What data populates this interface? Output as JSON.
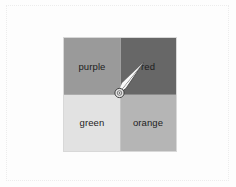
{
  "page": {
    "background_color": "#fdfdfd",
    "frame_color": "#ececec"
  },
  "grid": {
    "rows": 2,
    "columns": 2,
    "border_color": "#d8d8d8",
    "divider_color": "#cfcfcf",
    "label_color": "#1d1d1d",
    "quadrants": [
      {
        "label": "purple",
        "position": "top-left",
        "fill": "#9a9a9a"
      },
      {
        "label": "red",
        "position": "top-right",
        "fill": "#676767"
      },
      {
        "label": "green",
        "position": "bottom-left",
        "fill": "#e2e2e2"
      },
      {
        "label": "orange",
        "position": "bottom-right",
        "fill": "#b5b5b5"
      }
    ]
  },
  "cursor": {
    "icon": "mouse-pointer-arrow",
    "marker_icon": "click-target-ring",
    "x": 120,
    "y": 93,
    "fill": "#f4f4f4",
    "outline": "#3a3a3a"
  }
}
